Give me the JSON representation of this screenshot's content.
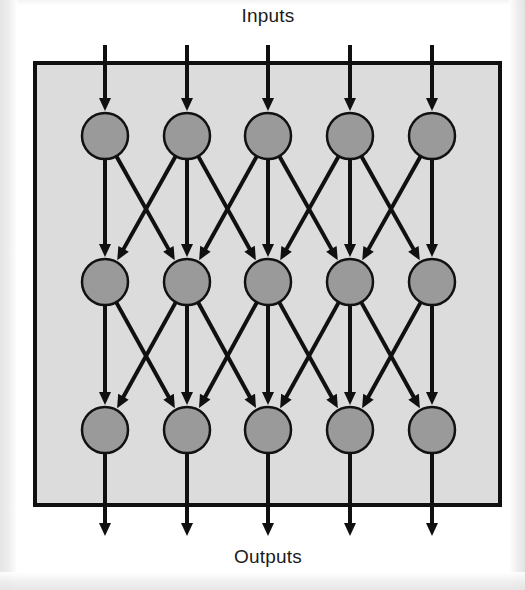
{
  "figure": {
    "title_top": "Inputs",
    "title_bottom": "Outputs",
    "width": 525,
    "height": 590
  },
  "colors": {
    "page_background": "#ffffff",
    "panel_fill": "#dcdcdc",
    "panel_stroke": "#101010",
    "node_fill": "#9a9a9a",
    "node_stroke": "#111111",
    "edge_stroke": "#101010",
    "text": "#1b1b1b"
  },
  "panel": {
    "x": 35,
    "y": 63,
    "width": 465,
    "height": 442,
    "stroke_width": 4
  },
  "geometry": {
    "node_radius": 23,
    "columns_x": [
      105,
      187,
      268,
      350,
      432
    ],
    "rows_y": [
      136,
      282,
      430
    ],
    "input_arrow_start_y": 45,
    "output_arrow_end_y": 536,
    "edge_stroke_width": 4,
    "arrow_head_length": 13,
    "arrow_head_half_width": 6
  },
  "labels": {
    "top_label_x": 268,
    "top_label_y": 22,
    "bottom_label_x": 268,
    "bottom_label_y": 563
  },
  "chart_data": {
    "type": "diagram",
    "diagram_kind": "layered-feedforward-network",
    "layer_count": 3,
    "nodes_per_layer": 5,
    "node_count_total": 15,
    "layers": [
      {
        "index": 0,
        "name": "layer-1",
        "nodes": [
          {
            "id": "n0-0",
            "col": 0,
            "row": 0
          },
          {
            "id": "n0-1",
            "col": 1,
            "row": 0
          },
          {
            "id": "n0-2",
            "col": 2,
            "row": 0
          },
          {
            "id": "n0-3",
            "col": 3,
            "row": 0
          },
          {
            "id": "n0-4",
            "col": 4,
            "row": 0
          }
        ]
      },
      {
        "index": 1,
        "name": "layer-2",
        "nodes": [
          {
            "id": "n1-0",
            "col": 0,
            "row": 1
          },
          {
            "id": "n1-1",
            "col": 1,
            "row": 1
          },
          {
            "id": "n1-2",
            "col": 2,
            "row": 1
          },
          {
            "id": "n1-3",
            "col": 3,
            "row": 1
          },
          {
            "id": "n1-4",
            "col": 4,
            "row": 1
          }
        ]
      },
      {
        "index": 2,
        "name": "layer-3",
        "nodes": [
          {
            "id": "n2-0",
            "col": 0,
            "row": 2
          },
          {
            "id": "n2-1",
            "col": 1,
            "row": 2
          },
          {
            "id": "n2-2",
            "col": 2,
            "row": 2
          },
          {
            "id": "n2-3",
            "col": 3,
            "row": 2
          },
          {
            "id": "n2-4",
            "col": 4,
            "row": 2
          }
        ]
      }
    ],
    "connection_rule": "each node connects downward to the node directly below and to its immediate left and right neighbours where they exist",
    "edges": [
      {
        "from_row": 0,
        "from_col": 0,
        "to_row": 1,
        "to_col": 0
      },
      {
        "from_row": 0,
        "from_col": 0,
        "to_row": 1,
        "to_col": 1
      },
      {
        "from_row": 0,
        "from_col": 1,
        "to_row": 1,
        "to_col": 0
      },
      {
        "from_row": 0,
        "from_col": 1,
        "to_row": 1,
        "to_col": 1
      },
      {
        "from_row": 0,
        "from_col": 1,
        "to_row": 1,
        "to_col": 2
      },
      {
        "from_row": 0,
        "from_col": 2,
        "to_row": 1,
        "to_col": 1
      },
      {
        "from_row": 0,
        "from_col": 2,
        "to_row": 1,
        "to_col": 2
      },
      {
        "from_row": 0,
        "from_col": 2,
        "to_row": 1,
        "to_col": 3
      },
      {
        "from_row": 0,
        "from_col": 3,
        "to_row": 1,
        "to_col": 2
      },
      {
        "from_row": 0,
        "from_col": 3,
        "to_row": 1,
        "to_col": 3
      },
      {
        "from_row": 0,
        "from_col": 3,
        "to_row": 1,
        "to_col": 4
      },
      {
        "from_row": 0,
        "from_col": 4,
        "to_row": 1,
        "to_col": 3
      },
      {
        "from_row": 0,
        "from_col": 4,
        "to_row": 1,
        "to_col": 4
      },
      {
        "from_row": 1,
        "from_col": 0,
        "to_row": 2,
        "to_col": 0
      },
      {
        "from_row": 1,
        "from_col": 0,
        "to_row": 2,
        "to_col": 1
      },
      {
        "from_row": 1,
        "from_col": 1,
        "to_row": 2,
        "to_col": 0
      },
      {
        "from_row": 1,
        "from_col": 1,
        "to_row": 2,
        "to_col": 1
      },
      {
        "from_row": 1,
        "from_col": 1,
        "to_row": 2,
        "to_col": 2
      },
      {
        "from_row": 1,
        "from_col": 2,
        "to_row": 2,
        "to_col": 1
      },
      {
        "from_row": 1,
        "from_col": 2,
        "to_row": 2,
        "to_col": 2
      },
      {
        "from_row": 1,
        "from_col": 2,
        "to_row": 2,
        "to_col": 3
      },
      {
        "from_row": 1,
        "from_col": 3,
        "to_row": 2,
        "to_col": 2
      },
      {
        "from_row": 1,
        "from_col": 3,
        "to_row": 2,
        "to_col": 3
      },
      {
        "from_row": 1,
        "from_col": 3,
        "to_row": 2,
        "to_col": 4
      },
      {
        "from_row": 1,
        "from_col": 4,
        "to_row": 2,
        "to_col": 3
      },
      {
        "from_row": 1,
        "from_col": 4,
        "to_row": 2,
        "to_col": 4
      }
    ],
    "input_arrows": [
      {
        "col": 0
      },
      {
        "col": 1
      },
      {
        "col": 2
      },
      {
        "col": 3
      },
      {
        "col": 4
      }
    ],
    "output_arrows": [
      {
        "col": 0
      },
      {
        "col": 1
      },
      {
        "col": 2
      },
      {
        "col": 3
      },
      {
        "col": 4
      }
    ],
    "annotations": [
      "Inputs",
      "Outputs"
    ]
  }
}
